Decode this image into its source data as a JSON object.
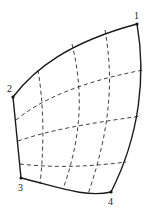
{
  "diagram": {
    "type": "curvilinear-quadrilateral-mesh",
    "colors": {
      "edge": "#1a1a1a",
      "mesh": "#2a2a2a",
      "background": "#ffffff"
    },
    "corners": [
      {
        "id": "1",
        "label": "1",
        "x": 137,
        "y": 24,
        "label_x": 134,
        "label_y": 19
      },
      {
        "id": "2",
        "label": "2",
        "x": 13,
        "y": 97,
        "label_x": 7,
        "label_y": 92
      },
      {
        "id": "3",
        "label": "3",
        "x": 21,
        "y": 178,
        "label_x": 18,
        "label_y": 191
      },
      {
        "id": "4",
        "label": "4",
        "x": 111,
        "y": 192,
        "label_x": 108,
        "label_y": 205
      }
    ],
    "edges": {
      "top_2_1": "M13,97 C35,68 70,42 137,24",
      "right_1_4": "M137,24 C146,75 140,135 111,192",
      "bottom_3_4": "M21,178 C55,186 85,198 111,192",
      "left_2_3": "M13,97 L21,178"
    },
    "mesh_lines": {
      "horizontal": [
        "M16,120 C40,100 80,82 143,70",
        "M18,141 C50,130 85,124 141,116",
        "M20,164 C45,167 80,168 126,162"
      ],
      "vertical": [
        "M38,70 C43,100 45,140 40,184",
        "M72,44 C82,85 84,130 63,189",
        "M105,30 C113,75 112,125 88,194"
      ]
    }
  }
}
